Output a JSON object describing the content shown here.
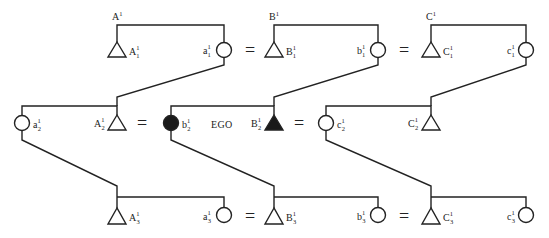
{
  "diagram": {
    "ego_label": "EGO",
    "equals": "=",
    "groups": {
      "A": "A",
      "B": "B",
      "C": "C"
    },
    "group_superscript": "1",
    "rows": [
      {
        "row": 1,
        "nodes": [
          {
            "id": "A1",
            "kind": "male",
            "base": "A",
            "sup": "1",
            "sub": "1"
          },
          {
            "id": "a1",
            "kind": "female",
            "base": "a",
            "sup": "1",
            "sub": "1"
          },
          {
            "id": "B1",
            "kind": "male",
            "base": "B",
            "sup": "1",
            "sub": "1"
          },
          {
            "id": "b1",
            "kind": "female",
            "base": "b",
            "sup": "1",
            "sub": "1"
          },
          {
            "id": "C1",
            "kind": "male",
            "base": "C",
            "sup": "1",
            "sub": "1"
          },
          {
            "id": "c1",
            "kind": "female",
            "base": "c",
            "sup": "1",
            "sub": "1"
          }
        ]
      },
      {
        "row": 2,
        "nodes": [
          {
            "id": "a2",
            "kind": "female",
            "base": "a",
            "sup": "1",
            "sub": "2"
          },
          {
            "id": "A2",
            "kind": "male",
            "base": "A",
            "sup": "1",
            "sub": "2"
          },
          {
            "id": "b2",
            "kind": "female-filled",
            "base": "b",
            "sup": "1",
            "sub": "2"
          },
          {
            "id": "B2",
            "kind": "male-filled",
            "base": "B",
            "sup": "1",
            "sub": "2"
          },
          {
            "id": "c2",
            "kind": "female",
            "base": "c",
            "sup": "1",
            "sub": "2"
          },
          {
            "id": "C2",
            "kind": "male",
            "base": "C",
            "sup": "1",
            "sub": "2"
          }
        ]
      },
      {
        "row": 3,
        "nodes": [
          {
            "id": "A3",
            "kind": "male",
            "base": "A",
            "sup": "1",
            "sub": "3"
          },
          {
            "id": "a3",
            "kind": "female",
            "base": "a",
            "sup": "1",
            "sub": "3"
          },
          {
            "id": "B3",
            "kind": "male",
            "base": "B",
            "sup": "1",
            "sub": "3"
          },
          {
            "id": "b3",
            "kind": "female",
            "base": "b",
            "sup": "1",
            "sub": "3"
          },
          {
            "id": "C3",
            "kind": "male",
            "base": "C",
            "sup": "1",
            "sub": "3"
          },
          {
            "id": "c3",
            "kind": "female",
            "base": "c",
            "sup": "1",
            "sub": "3"
          }
        ]
      }
    ],
    "colors": {
      "line": "#222222",
      "fill_highlight": "#1a1a1a",
      "background": "#ffffff"
    }
  }
}
